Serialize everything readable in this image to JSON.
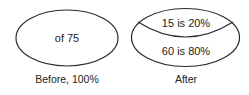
{
  "diagram": {
    "before": {
      "inner_text": "of 75",
      "caption": "Before, 100%"
    },
    "after": {
      "top_segment_text": "15 is 20%",
      "bottom_segment_text": "60 is 80%",
      "caption": "After"
    },
    "colors": {
      "stroke": "#2a2a2a",
      "text": "#222222",
      "background": "#ffffff"
    }
  }
}
